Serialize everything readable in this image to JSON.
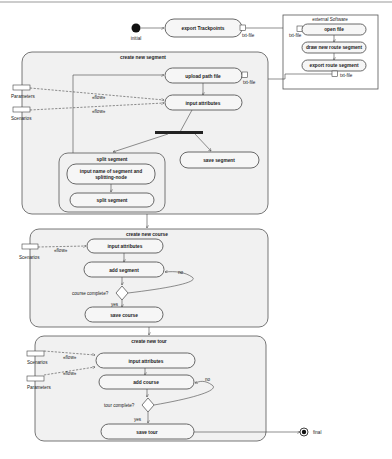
{
  "initial_label": "initial",
  "final_label": "final",
  "top": {
    "export_trackpoints": "export Trackpoints",
    "pin_out": "txt-file"
  },
  "external": {
    "title": "external Software",
    "pin_in": "txt-file",
    "open_file": "open file",
    "draw_segment": "draw new route segment",
    "export_segment": "export route segment",
    "pin_out": "txt-file"
  },
  "segment": {
    "title": "create new segment",
    "upload_path_file": "upload path file",
    "pin_in": "txt-file",
    "input_attributes": "input attributes",
    "object_parameters": "Parameters",
    "object_scenarios": "Scenarios",
    "flow1": "«flow»",
    "flow2": "«flow»",
    "split": {
      "title": "split segment",
      "input_name_line1": "input name of segment and",
      "input_name_line2": "splitting-node",
      "split_action": "split segment"
    },
    "save_segment": "save segment"
  },
  "course": {
    "title": "create new course",
    "object_scenarios": "Scenarios",
    "flow": "«flow»",
    "input_attributes": "input attributes",
    "add_segment": "add segment",
    "decision_label": "course complete?",
    "no": "no",
    "yes": "yes",
    "save_course": "save course"
  },
  "tour": {
    "title": "create new tour",
    "object_scenarios": "Scenarios",
    "object_parameters": "Parameters",
    "flow1": "«flow»",
    "flow2": "«flow»",
    "input_attributes": "input attributes",
    "add_course": "add course",
    "decision_label": "tour complete?",
    "no": "no",
    "yes": "yes",
    "save_tour": "save tour"
  }
}
